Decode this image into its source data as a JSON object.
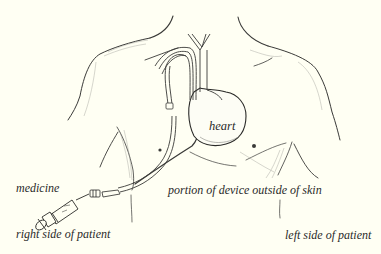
{
  "diagram": {
    "type": "medical-illustration",
    "labels": {
      "heart": "heart",
      "medicine": "medicine",
      "portion_outside": "portion of device outside of skin",
      "right_side": "right side of patient",
      "left_side": "left side of patient"
    },
    "components": [
      {
        "name": "torso-outline",
        "description": "Line drawing of upper torso, neck and shoulders"
      },
      {
        "name": "heart",
        "description": "Heart organ in center of chest"
      },
      {
        "name": "catheter",
        "description": "Tube entering vein near collarbone, curving down into heart, exiting through chest skin"
      },
      {
        "name": "syringe",
        "description": "Syringe delivering medicine into catheter hub"
      }
    ],
    "colors": {
      "background": "#fffff3",
      "ink": "#2a2a2a",
      "shading": "#8a8a84"
    }
  }
}
